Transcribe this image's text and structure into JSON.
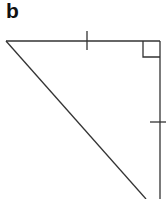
{
  "figure": {
    "label": "b",
    "shape": "right-triangle",
    "markings": [
      "equal-length tick on top leg",
      "equal-length tick on vertical leg",
      "right-angle square at top-right vertex"
    ],
    "stroke_color": "#333333"
  }
}
